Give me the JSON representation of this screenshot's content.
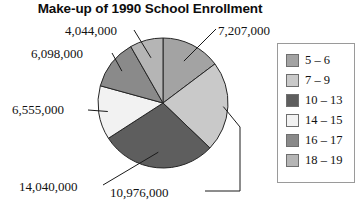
{
  "chart": {
    "title": "Make-up of 1990 School Enrollment"
  },
  "legend": {
    "items": [
      {
        "label": "5 – 6",
        "color": "#a3a3a3"
      },
      {
        "label": "7 – 9",
        "color": "#c9c9c9"
      },
      {
        "label": "10 – 13",
        "color": "#5e5e5e"
      },
      {
        "label": "14 – 15",
        "color": "#f2f2f2"
      },
      {
        "label": "16 – 17",
        "color": "#8a8a8a"
      },
      {
        "label": "18 – 19",
        "color": "#b5b5b5"
      }
    ]
  },
  "labels": {
    "age_5_6": "7,207,000",
    "age_7_9": "10,976,000",
    "age_10_13": "14,040,000",
    "age_14_15": "6,555,000",
    "age_16_17": "6,098,000",
    "age_18_19": "4,044,000"
  },
  "chart_data": {
    "type": "pie",
    "title": "Make-up of 1990 School Enrollment",
    "xlabel": "",
    "ylabel": "",
    "legend_position": "right",
    "grid": false,
    "total": 48920000,
    "categories": [
      "5 – 6",
      "7 – 9",
      "10 – 13",
      "14 – 15",
      "16 – 17",
      "18 – 19"
    ],
    "values": [
      7207000,
      10976000,
      14040000,
      6555000,
      6098000,
      4044000
    ],
    "value_labels": [
      "7,207,000",
      "10,976,000",
      "14,040,000",
      "6,555,000",
      "6,098,000",
      "4,044,000"
    ],
    "colors": [
      "#a3a3a3",
      "#c9c9c9",
      "#5e5e5e",
      "#f2f2f2",
      "#8a8a8a",
      "#b5b5b5"
    ],
    "percentages": [
      14.7,
      22.4,
      28.7,
      13.4,
      12.5,
      8.3
    ],
    "slice_angles_deg": [
      53.0,
      80.8,
      103.3,
      48.2,
      44.9,
      29.8
    ],
    "start_angle_deg": 0,
    "direction": "clockwise",
    "slices": [
      {
        "category": "5 – 6",
        "value": 7207000,
        "label": "7,207,000",
        "color": "#a3a3a3",
        "percent": 14.7,
        "angle_deg": 53.0
      },
      {
        "category": "7 – 9",
        "value": 10976000,
        "label": "10,976,000",
        "color": "#c9c9c9",
        "percent": 22.4,
        "angle_deg": 80.8
      },
      {
        "category": "10 – 13",
        "value": 14040000,
        "label": "14,040,000",
        "color": "#5e5e5e",
        "percent": 28.7,
        "angle_deg": 103.3
      },
      {
        "category": "14 – 15",
        "value": 6555000,
        "label": "6,555,000",
        "color": "#f2f2f2",
        "percent": 13.4,
        "angle_deg": 48.2
      },
      {
        "category": "16 – 17",
        "value": 6098000,
        "label": "6,098,000",
        "color": "#8a8a8a",
        "percent": 12.5,
        "angle_deg": 44.9
      },
      {
        "category": "18 – 19",
        "value": 4044000,
        "label": "4,044,000",
        "color": "#b5b5b5",
        "percent": 8.3,
        "angle_deg": 29.8
      }
    ]
  }
}
